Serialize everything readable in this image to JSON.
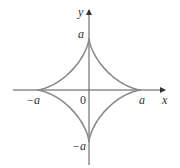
{
  "figure": {
    "curve_equation": "x^(2/3) + y^(2/3) = a^(2/3)",
    "colors": {
      "curve": "#8a8a8a",
      "axes": "#555555",
      "text": "#333333"
    },
    "labels": {
      "x_axis": "x",
      "y_axis": "y",
      "origin": "0",
      "pos_x": "a",
      "neg_x": "−a",
      "pos_y": "a",
      "neg_y": "−a"
    },
    "cusps": [
      {
        "x": "a",
        "y": "0"
      },
      {
        "x": "0",
        "y": "a"
      },
      {
        "x": "−a",
        "y": "0"
      },
      {
        "x": "0",
        "y": "−a"
      }
    ]
  }
}
